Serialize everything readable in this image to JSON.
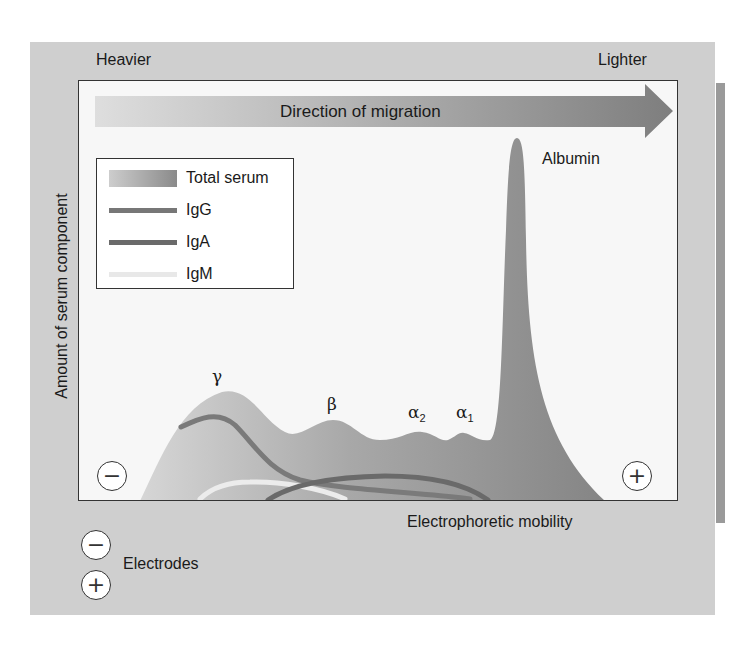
{
  "figure": {
    "corner_labels": {
      "left": "Heavier",
      "right": "Lighter"
    },
    "arrow": {
      "label": "Direction of migration"
    },
    "y_axis_label": "Amount of serum component",
    "x_axis_label": "Electrophoretic mobility",
    "peak_labels": {
      "gamma": "γ",
      "beta": "β",
      "alpha2": "α",
      "alpha2_sub": "2",
      "alpha1": "α",
      "alpha1_sub": "1",
      "albumin": "Albumin"
    },
    "electrodes": {
      "label": "Electrodes",
      "negative_symbol": "−",
      "positive_symbol": "+"
    },
    "legend": {
      "items": [
        {
          "label": "Total serum",
          "style": "area-gradient"
        },
        {
          "label": "IgG",
          "style": "line",
          "color": "#777777"
        },
        {
          "label": "IgA",
          "style": "line",
          "color": "#6a6a6a"
        },
        {
          "label": "IgM",
          "style": "line",
          "color": "#e8e8e8"
        }
      ]
    },
    "colors": {
      "panel_bg": "#cfcfcf",
      "plot_bg": "#f7f7f7",
      "total_serum_light": "#d2d2d2",
      "total_serum_dark": "#8c8c8c",
      "igg": "#777777",
      "iga": "#6a6a6a",
      "igm": "#e8e8e8"
    }
  }
}
